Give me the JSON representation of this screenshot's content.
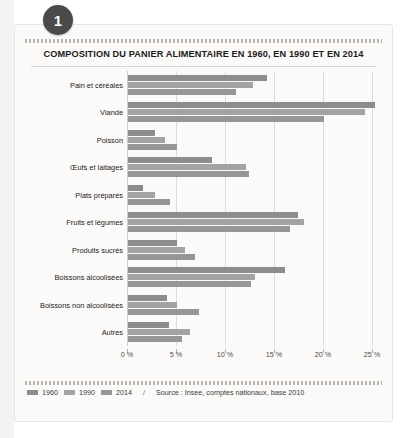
{
  "badge": {
    "number": "1"
  },
  "chart_data": {
    "type": "bar",
    "orientation": "horizontal",
    "title": "COMPOSITION DU PANIER ALIMENTAIRE EN 1960, EN 1990 ET EN 2014",
    "xlabel": "",
    "ylabel": "",
    "xlim": [
      0,
      25
    ],
    "grid": true,
    "legend_position": "bottom-left",
    "tick_labels": [
      "0 %",
      "5 %",
      "10 %",
      "15 %",
      "20 %",
      "25 %"
    ],
    "ticks": [
      0,
      5,
      10,
      15,
      20,
      25
    ],
    "categories": [
      "Pain et céréales",
      "Viande",
      "Poisson",
      "Œufs et laitages",
      "Plats préparés",
      "Fruits et légumes",
      "Produits sucrés",
      "Boissons alcoolisées",
      "Boissons non alcoolisées",
      "Autres"
    ],
    "series": [
      {
        "name": "1960",
        "color": "#8d8d8d",
        "values": [
          14.2,
          25.2,
          2.8,
          8.6,
          1.5,
          17.3,
          5.0,
          16.0,
          4.0,
          4.2
        ]
      },
      {
        "name": "1990",
        "color": "#a3a3a3",
        "values": [
          12.8,
          24.2,
          3.8,
          12.0,
          2.8,
          18.0,
          5.8,
          13.0,
          5.0,
          6.3
        ]
      },
      {
        "name": "2014",
        "color": "#969696",
        "values": [
          11.0,
          20.0,
          5.0,
          12.3,
          4.3,
          16.5,
          6.8,
          12.5,
          7.2,
          5.5
        ]
      }
    ],
    "source_separator": "/",
    "source": "Source : Insee, comptes nationaux, base 2010"
  }
}
